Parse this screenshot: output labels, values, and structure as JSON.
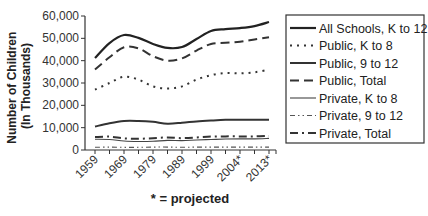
{
  "chart_data": {
    "type": "line",
    "title": "",
    "xlabel": "",
    "ylabel": "Number of Children (In Thousands)",
    "ylim": [
      0,
      60000
    ],
    "yticks": [
      "0",
      "10,000",
      "20,000",
      "30,000",
      "40,000",
      "50,000",
      "60,000"
    ],
    "x_tick_labels": [
      "1959",
      "1969",
      "1979",
      "1989",
      "1999",
      "2004*",
      "2013*"
    ],
    "x": [
      1959,
      1964,
      1969,
      1974,
      1979,
      1984,
      1989,
      1994,
      1999,
      2002,
      2004,
      2009,
      2013
    ],
    "footnote": "* = projected",
    "grid": false,
    "legend_position": "right",
    "series": [
      {
        "name": "All Schools, K to 12",
        "style": "solid-thick",
        "values": [
          41200,
          47900,
          51500,
          50200,
          47500,
          45700,
          46100,
          49700,
          53300,
          54100,
          54600,
          55500,
          57300
        ]
      },
      {
        "name": "Public, K to 8",
        "style": "dotted",
        "values": [
          27000,
          30000,
          32800,
          31500,
          28500,
          27500,
          28500,
          31500,
          33500,
          34500,
          34300,
          34800,
          36000
        ]
      },
      {
        "name": "Public, 9 to 12",
        "style": "solid",
        "values": [
          10500,
          12000,
          13000,
          13000,
          12600,
          11800,
          12200,
          12800,
          13200,
          13500,
          13500,
          13500,
          13500
        ]
      },
      {
        "name": "Public, Total",
        "style": "dashed",
        "values": [
          36000,
          41500,
          46000,
          45500,
          42000,
          40000,
          41000,
          44500,
          47500,
          48000,
          48500,
          49500,
          50500
        ]
      },
      {
        "name": "Private, K to 8",
        "style": "solid-thin",
        "values": [
          4800,
          4700,
          4000,
          3800,
          3900,
          4300,
          4200,
          4500,
          4700,
          4900,
          5000,
          5000,
          5200
        ]
      },
      {
        "name": "Private, 9 to 12",
        "style": "dash-dot-dot",
        "values": [
          1200,
          1300,
          1200,
          1200,
          1300,
          1300,
          1200,
          1300,
          1300,
          1300,
          1300,
          1300,
          1300
        ]
      },
      {
        "name": "Private, Total",
        "style": "dash-dot",
        "values": [
          5800,
          6000,
          5200,
          5000,
          5300,
          5600,
          5300,
          5600,
          6000,
          6100,
          6100,
          6100,
          6300
        ]
      }
    ]
  }
}
